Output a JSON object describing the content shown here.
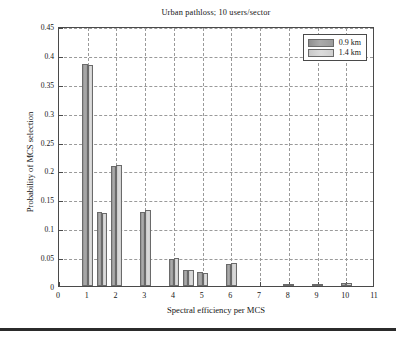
{
  "chart_data": {
    "type": "bar",
    "title": "Urban pathloss; 10 users/sector",
    "xlabel": "Spectral efficiency per MCS",
    "ylabel": "Probability of MCS selection",
    "xlim": [
      0,
      11
    ],
    "ylim": [
      0,
      0.45
    ],
    "grid": true,
    "legend_position": "top-right",
    "x_ticks": [
      "0",
      "1",
      "2",
      "3",
      "4",
      "5",
      "6",
      "7",
      "8",
      "9",
      "10",
      "11"
    ],
    "y_ticks": [
      "0",
      "0.05",
      "0.1",
      "0.15",
      "0.2",
      "0.25",
      "0.3",
      "0.35",
      "0.4",
      "0.45"
    ],
    "series": [
      {
        "name": "0.9 km",
        "color": "#a0a0a0",
        "points": [
          {
            "x": 1.0,
            "y": 0.385
          },
          {
            "x": 1.5,
            "y": 0.128
          },
          {
            "x": 2.0,
            "y": 0.208
          },
          {
            "x": 3.0,
            "y": 0.128
          },
          {
            "x": 4.0,
            "y": 0.047
          },
          {
            "x": 4.5,
            "y": 0.028
          },
          {
            "x": 5.0,
            "y": 0.024
          },
          {
            "x": 6.0,
            "y": 0.038
          },
          {
            "x": 8.0,
            "y": 0.003
          },
          {
            "x": 9.0,
            "y": 0.004
          },
          {
            "x": 10.0,
            "y": 0.005
          }
        ]
      },
      {
        "name": "1.4 km",
        "color": "#d2d2d2",
        "points": [
          {
            "x": 1.0,
            "y": 0.383
          },
          {
            "x": 1.5,
            "y": 0.126
          },
          {
            "x": 2.0,
            "y": 0.21
          },
          {
            "x": 3.0,
            "y": 0.131
          },
          {
            "x": 4.0,
            "y": 0.049
          },
          {
            "x": 4.5,
            "y": 0.028
          },
          {
            "x": 5.0,
            "y": 0.022
          },
          {
            "x": 6.0,
            "y": 0.039
          },
          {
            "x": 8.0,
            "y": 0.003
          },
          {
            "x": 9.0,
            "y": 0.004
          },
          {
            "x": 10.0,
            "y": 0.005
          }
        ]
      }
    ]
  },
  "legend": {
    "items": [
      {
        "label": "0.9 km"
      },
      {
        "label": "1.4 km"
      }
    ]
  }
}
